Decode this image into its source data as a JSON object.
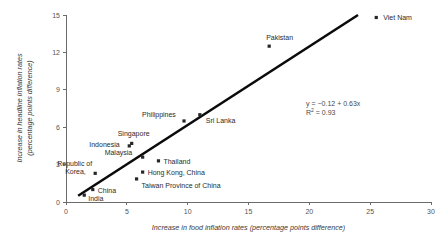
{
  "chart_data": {
    "type": "scatter",
    "title": "",
    "xlabel": "Increase in food inflation rates (percentage points difference)",
    "ylabel_line1": "Increase in headline inflation rates",
    "ylabel_line2": "(percentage points difference)",
    "xlim": [
      0,
      30
    ],
    "ylim": [
      0,
      15
    ],
    "xticks": [
      "0",
      "5",
      "10",
      "15",
      "20",
      "25",
      "30"
    ],
    "yticks": [
      "0",
      "3",
      "6",
      "9",
      "12",
      "15"
    ],
    "grid": false,
    "legend": "none",
    "marker_color": "#262626",
    "trendline_color": "#0b0b0b",
    "annotations": {
      "equation": "y = −0.12 + 0.63x",
      "r_squared_label": "R",
      "r_squared_sup": "2",
      "r_squared_value": " = 0.93"
    },
    "trendline": {
      "x_start": 1.0,
      "y_start": 0.5,
      "x_end": 24.0,
      "y_end": 15.0
    },
    "points": [
      {
        "name": "Viet Nam",
        "x": 25.5,
        "y": 14.8,
        "label": "Viet Nam",
        "label_dx": 7,
        "label_dy": 3
      },
      {
        "name": "Pakistan",
        "x": 16.7,
        "y": 12.5,
        "label": "Pakistan",
        "label_dx": -3,
        "label_dy": -6
      },
      {
        "name": "Sri Lanka",
        "x": 11.0,
        "y": 7.0,
        "label": "Sri Lanka",
        "label_dx": 6,
        "label_dy": 8
      },
      {
        "name": "Philippines",
        "x": 9.7,
        "y": 6.5,
        "label": "Philippines",
        "label_dx": -42,
        "label_dy": -4
      },
      {
        "name": "Singapore",
        "x": 5.4,
        "y": 4.7,
        "label": "Singapore",
        "label_dx": -14,
        "label_dy": -7
      },
      {
        "name": "Indonesia",
        "x": 5.2,
        "y": 4.5,
        "label": "Indonesia",
        "label_dx": -40,
        "label_dy": 1
      },
      {
        "name": "Malaysia",
        "x": 6.3,
        "y": 3.6,
        "label": "Malaysia",
        "label_dx": -38,
        "label_dy": -2
      },
      {
        "name": "Thailand",
        "x": 7.6,
        "y": 3.3,
        "label": "Thailand",
        "label_dx": 5,
        "label_dy": 3
      },
      {
        "name": "Hong Kong, China",
        "x": 6.3,
        "y": 2.4,
        "label": "Hong Kong, China",
        "label_dx": 5,
        "label_dy": 3
      },
      {
        "name": "Republic of Korea",
        "x": 2.4,
        "y": 2.3,
        "label": "Republic of\nKorea,",
        "label_dx": -38,
        "label_dy": -7
      },
      {
        "name": "Taiwan Province of China",
        "x": 5.8,
        "y": 1.85,
        "label": "Taiwan Province of China",
        "label_dx": 5,
        "label_dy": 9
      },
      {
        "name": "China",
        "x": 2.2,
        "y": 1.0,
        "label": "China",
        "label_dx": 5,
        "label_dy": 3
      },
      {
        "name": "India",
        "x": 1.5,
        "y": 0.55,
        "label": "India",
        "label_dx": 4,
        "label_dy": 6
      }
    ]
  }
}
